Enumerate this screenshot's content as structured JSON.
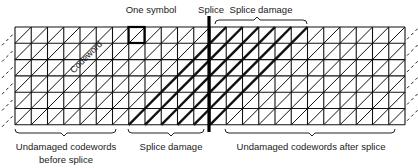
{
  "diagram": {
    "type": "tape-track-splice-diagram",
    "grid": {
      "columns": 24,
      "rows": 6,
      "cell_description": "each square is one symbol, each diagonal line is a codeword"
    },
    "labels": {
      "one_symbol": "One symbol",
      "splice": "Splice",
      "splice_damage_top": "Splice damage",
      "codeword": "Codeword",
      "undamaged_before": "Undamaged codewords",
      "undamaged_before_2": "before splice",
      "splice_damage_bottom": "Splice damage",
      "undamaged_after": "Undamaged codewords after splice"
    },
    "colors": {
      "line": "#111111",
      "background": "#ffffff"
    }
  }
}
